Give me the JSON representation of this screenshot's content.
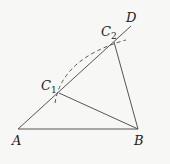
{
  "diagram": {
    "points": {
      "A": {
        "label": "A",
        "x": 18,
        "y": 129
      },
      "B": {
        "label": "B",
        "x": 138,
        "y": 129
      },
      "C1": {
        "label": "C",
        "sub": "1",
        "x": 59,
        "y": 93
      },
      "C2": {
        "label": "C",
        "sub": "2",
        "x": 114,
        "y": 42
      },
      "D": {
        "label": "D",
        "x": 131,
        "y": 26
      }
    },
    "segments": [
      [
        "A",
        "D"
      ],
      [
        "A",
        "B"
      ],
      [
        "C1",
        "B"
      ],
      [
        "C2",
        "B"
      ]
    ],
    "arc": {
      "from": "C1",
      "to": "C2",
      "style": "dashed"
    },
    "line_color": "#555555"
  }
}
